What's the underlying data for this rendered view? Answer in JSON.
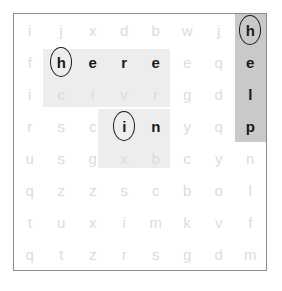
{
  "puzzle": {
    "type": "word-search",
    "rows": 8,
    "cols": 8,
    "colors": {
      "page_background": "#ffffff",
      "frame_border": "#8c8c8c",
      "filler_letter": "#dcdcdc",
      "found_letter": "#1a1a1a",
      "highlight_light": "#ededed",
      "highlight_dark": "#c9c9c9",
      "circle_stroke": "#1a1a1a"
    },
    "grid": [
      [
        "i",
        "j",
        "x",
        "d",
        "b",
        "w",
        "j",
        "h"
      ],
      [
        "f",
        "h",
        "e",
        "r",
        "e",
        "e",
        "q",
        "e"
      ],
      [
        "i",
        "c",
        "i",
        "v",
        "r",
        "g",
        "d",
        "l"
      ],
      [
        "r",
        "s",
        "c",
        "i",
        "n",
        "y",
        "q",
        "p"
      ],
      [
        "u",
        "s",
        "g",
        "x",
        "b",
        "c",
        "y",
        "n"
      ],
      [
        "q",
        "z",
        "z",
        "s",
        "c",
        "b",
        "o",
        "l"
      ],
      [
        "t",
        "u",
        "x",
        "i",
        "m",
        "k",
        "v",
        "f"
      ],
      [
        "q",
        "t",
        "z",
        "r",
        "s",
        "g",
        "d",
        "m"
      ]
    ],
    "found_words": [
      {
        "word": "here",
        "orientation": "horizontal",
        "row": 1,
        "col_start": 1,
        "col_end": 4,
        "highlight": "light",
        "circled_letter": "h",
        "circled_row": 1,
        "circled_col": 1
      },
      {
        "word": "in",
        "orientation": "horizontal",
        "row": 3,
        "col_start": 3,
        "col_end": 4,
        "highlight": "light",
        "circled_letter": "i",
        "circled_row": 3,
        "circled_col": 3
      },
      {
        "word": "help",
        "orientation": "vertical",
        "col": 7,
        "row_start": 0,
        "row_end": 3,
        "highlight": "dark",
        "circled_letter": "h",
        "circled_row": 0,
        "circled_col": 7
      }
    ],
    "highlight_bands": [
      {
        "name": "help-column-highlight",
        "shade": "dark",
        "left_pct": 87.5,
        "top_pct": 0,
        "width_pct": 12.5,
        "height_pct": 50
      },
      {
        "name": "here-row-highlight",
        "shade": "light",
        "left_pct": 11.5,
        "top_pct": 13.5,
        "width_pct": 50.5,
        "height_pct": 23
      },
      {
        "name": "in-row-highlight",
        "shade": "light",
        "left_pct": 33.5,
        "top_pct": 37,
        "width_pct": 28.5,
        "height_pct": 23
      }
    ],
    "circles": [
      {
        "name": "circle-h-help",
        "row": 0,
        "col": 7
      },
      {
        "name": "circle-h-here",
        "row": 1,
        "col": 1
      },
      {
        "name": "circle-i-in",
        "row": 3,
        "col": 3
      }
    ]
  }
}
